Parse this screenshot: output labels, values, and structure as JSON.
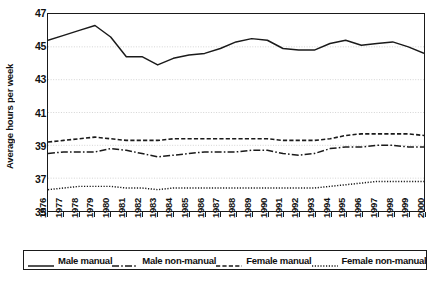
{
  "chart_data": {
    "type": "line",
    "title": "",
    "xlabel": "",
    "ylabel": "Average hours per week",
    "ylim": [
      35,
      47
    ],
    "yticks": [
      35,
      37,
      39,
      41,
      43,
      45,
      47
    ],
    "grid": true,
    "grid_orientation": "horizontal",
    "legend_position": "below",
    "x": [
      1976,
      1977,
      1978,
      1979,
      1980,
      1981,
      1982,
      1983,
      1984,
      1985,
      1986,
      1987,
      1988,
      1989,
      1990,
      1991,
      1992,
      1993,
      1994,
      1995,
      1996,
      1997,
      1998,
      1999,
      2000
    ],
    "categories": [
      "1976",
      "1977",
      "1978",
      "1979",
      "1980",
      "1981",
      "1982",
      "1983",
      "1984",
      "1985",
      "1986",
      "1987",
      "1988",
      "1989",
      "1990",
      "1991",
      "1992",
      "1993",
      "1994",
      "1995",
      "1996",
      "1997",
      "1998",
      "1999",
      "2000"
    ],
    "series": [
      {
        "name": "Male manual",
        "style": "solid",
        "color": "#1a1a1a",
        "values": [
          45.4,
          45.7,
          46.0,
          46.3,
          45.6,
          44.4,
          44.4,
          43.9,
          44.3,
          44.5,
          44.6,
          44.9,
          45.3,
          45.5,
          45.4,
          44.9,
          44.8,
          44.8,
          45.2,
          45.4,
          45.1,
          45.2,
          45.3,
          45.0,
          44.6
        ]
      },
      {
        "name": "Male non-manual",
        "style": "dashdot",
        "color": "#1a1a1a",
        "values": [
          38.5,
          38.6,
          38.6,
          38.6,
          38.8,
          38.7,
          38.5,
          38.3,
          38.4,
          38.5,
          38.6,
          38.6,
          38.6,
          38.7,
          38.7,
          38.5,
          38.4,
          38.5,
          38.8,
          38.9,
          38.9,
          39.0,
          39.0,
          38.9,
          38.9
        ]
      },
      {
        "name": "Female manual",
        "style": "dashed",
        "color": "#1a1a1a",
        "values": [
          39.2,
          39.3,
          39.4,
          39.5,
          39.4,
          39.3,
          39.3,
          39.3,
          39.4,
          39.4,
          39.4,
          39.4,
          39.4,
          39.4,
          39.4,
          39.3,
          39.3,
          39.3,
          39.4,
          39.6,
          39.7,
          39.7,
          39.7,
          39.7,
          39.6
        ]
      },
      {
        "name": "Female non-manual",
        "style": "dotted",
        "color": "#1a1a1a",
        "values": [
          36.3,
          36.4,
          36.5,
          36.5,
          36.5,
          36.4,
          36.4,
          36.3,
          36.4,
          36.4,
          36.4,
          36.4,
          36.4,
          36.4,
          36.4,
          36.4,
          36.4,
          36.4,
          36.5,
          36.6,
          36.7,
          36.8,
          36.8,
          36.8,
          36.8
        ]
      }
    ]
  },
  "legend": {
    "items": [
      {
        "label": "Male manual"
      },
      {
        "label": "Male non-manual"
      },
      {
        "label": "Female manual"
      },
      {
        "label": "Female non-manual"
      }
    ]
  },
  "caption": {
    "text": ""
  }
}
